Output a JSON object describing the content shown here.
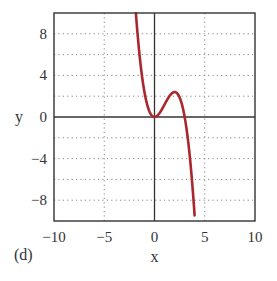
{
  "chart_data": {
    "type": "line",
    "title": "",
    "panel_label": "(d)",
    "xlabel": "x",
    "ylabel": "y",
    "xlim": [
      -10,
      10
    ],
    "ylim": [
      -10,
      10
    ],
    "x_ticks": [
      -10,
      -5,
      0,
      5,
      10
    ],
    "x_tick_labels": [
      "−10",
      "−5",
      "0",
      "5",
      "10"
    ],
    "y_ticks": [
      -8,
      -4,
      0,
      4,
      8
    ],
    "y_tick_labels": [
      "−8",
      "−4",
      "0",
      "4",
      "8"
    ],
    "grid": {
      "on": true,
      "style": "dotted",
      "x_lines": [
        -5,
        5
      ],
      "y_lines": [
        -8,
        -6,
        -4,
        -2,
        2,
        4,
        6,
        8
      ]
    },
    "legend": null,
    "series": [
      {
        "name": "y = 0.6 x^2 (3 - x)",
        "color": "#a8282e",
        "x": [
          -1.85,
          -1.5,
          -1.0,
          -0.5,
          0.0,
          0.5,
          1.0,
          1.5,
          2.0,
          2.5,
          3.0,
          3.5,
          4.0
        ],
        "y": [
          10.0,
          6.08,
          2.4,
          0.53,
          0.0,
          0.38,
          1.2,
          2.03,
          2.4,
          1.88,
          0.0,
          -3.68,
          -9.6
        ]
      }
    ],
    "annotations": [
      "Local minimum touching 0 at x=0",
      "Local maximum ≈2.4 at x≈2",
      "Root at x≈3"
    ]
  },
  "colors": {
    "curve": "#a8282e",
    "axes": "#333333",
    "grid": "#888888"
  }
}
